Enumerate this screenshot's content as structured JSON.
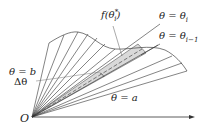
{
  "diagram": {
    "origin_label": "O",
    "labels": {
      "theta_b": "θ = b",
      "delta_theta": "Δθ",
      "theta_a": "θ = a",
      "theta_i": "θ = θ",
      "theta_i_sub": "i",
      "theta_i1": "θ = θ",
      "theta_i1_sub": "i−1",
      "f_theta": "f(θ",
      "f_theta_sup": "*",
      "f_theta_sub": "i",
      "f_theta_close": ")"
    },
    "colors": {
      "line": "#333333",
      "shade": "#d8d8d8",
      "background": "#ffffff"
    }
  }
}
